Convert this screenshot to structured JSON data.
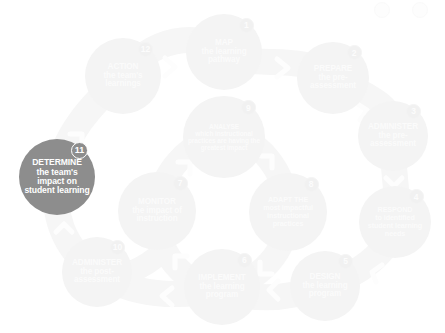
{
  "diagram": {
    "type": "cyclical-process",
    "active_step_number": "11",
    "colors": {
      "active_fill": "#8d8d8d",
      "active_text": "#ffffff",
      "pale_fill": "#f4f4f4",
      "pale_text": "#fbfbfb",
      "band": "#f6f6f6",
      "background": "#ffffff"
    },
    "steps": [
      {
        "number": "1",
        "head": "MAP",
        "body": "the learning pathway",
        "state": "pale",
        "cx": 224,
        "cy": 52,
        "r": 38
      },
      {
        "number": "2",
        "head": "PREPARE",
        "body": "the pre-assessment",
        "state": "pale",
        "cx": 333,
        "cy": 78,
        "r": 36
      },
      {
        "number": "3",
        "head": "ADMINISTER",
        "body": "the pre-assessment",
        "state": "pale",
        "cx": 393,
        "cy": 136,
        "r": 35
      },
      {
        "number": "4",
        "head": "RESPOND",
        "body": "to identified student learning needs",
        "state": "pale",
        "cx": 395,
        "cy": 222,
        "r": 36
      },
      {
        "number": "5",
        "head": "DESIGN",
        "body": "the learning program",
        "state": "pale",
        "cx": 325,
        "cy": 286,
        "r": 35
      },
      {
        "number": "6",
        "head": "IMPLEMENT",
        "body": "the learning program",
        "state": "pale",
        "cx": 222,
        "cy": 287,
        "r": 38
      },
      {
        "number": "7",
        "head": "MONITOR",
        "body": "the impact of instruction",
        "state": "pale",
        "cx": 157,
        "cy": 211,
        "r": 39
      },
      {
        "number": "8",
        "head": "ADAPT the",
        "body": "most impactful instructional practices",
        "state": "pale",
        "cx": 288,
        "cy": 212,
        "r": 39
      },
      {
        "number": "9",
        "head": "ANALYSE",
        "body": "which instructional practices are having the greatest impact",
        "state": "pale",
        "cx": 224,
        "cy": 137,
        "r": 41
      },
      {
        "number": "10",
        "head": "ADMINISTER",
        "body": "the post-assessment",
        "state": "pale",
        "cx": 97,
        "cy": 272,
        "r": 35
      },
      {
        "number": "11",
        "head": "DETERMINE",
        "body": "the team's impact on student learning",
        "state": "active",
        "cx": 57,
        "cy": 177,
        "r": 38
      },
      {
        "number": "12",
        "head": "ACTION",
        "body": "the team's learnings",
        "state": "pale",
        "cx": 123,
        "cy": 76,
        "r": 38
      }
    ],
    "connectors": [
      {
        "from": "12",
        "to": "1",
        "glyph": "chevron-right"
      },
      {
        "from": "1",
        "to": "2",
        "glyph": "chevron-right"
      },
      {
        "from": "2",
        "to": "3",
        "glyph": "chevron-down-right"
      },
      {
        "from": "3",
        "to": "4",
        "glyph": "chevron-down"
      },
      {
        "from": "4",
        "to": "5",
        "glyph": "chevron-down-left"
      },
      {
        "from": "5",
        "to": "6",
        "glyph": "chevron-left"
      },
      {
        "from": "6",
        "to": "10",
        "glyph": "chevron-left"
      },
      {
        "from": "10",
        "to": "11",
        "glyph": "chevron-up"
      },
      {
        "from": "11",
        "to": "12",
        "glyph": "chevron-up-right"
      },
      {
        "from": "7",
        "to": "9",
        "glyph": "chevron-up-right"
      },
      {
        "from": "9",
        "to": "8",
        "glyph": "chevron-down-right"
      },
      {
        "from": "8",
        "to": "6",
        "glyph": "chevron-down-left"
      },
      {
        "from": "6",
        "to": "7",
        "glyph": "chevron-up-left"
      }
    ],
    "corner_marks": [
      {
        "name": "corner-mark-left",
        "x": 374,
        "y": 2,
        "size": 14
      },
      {
        "name": "corner-mark-right",
        "x": 412,
        "y": 2,
        "size": 14
      }
    ]
  }
}
